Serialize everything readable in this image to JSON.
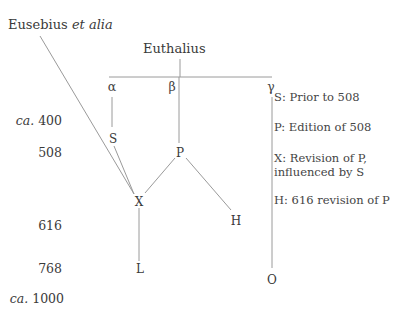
{
  "sources": {
    "eusebius": {
      "name": "Eusebius",
      "suffix": "et alia"
    },
    "euthalius": "Euthalius"
  },
  "branches": [
    "α",
    "β",
    "γ"
  ],
  "dates": [
    "ca. 400",
    "508",
    "616",
    "768",
    "ca. 1000"
  ],
  "dates_display": [
    {
      "prefix": "ca.",
      "value": "400"
    },
    {
      "prefix": "",
      "value": "508"
    },
    {
      "prefix": "",
      "value": "616"
    },
    {
      "prefix": "",
      "value": "768"
    },
    {
      "prefix": "ca.",
      "value": "1000"
    }
  ],
  "nodes": {
    "S": "S",
    "P": "P",
    "X": "X",
    "H": "H",
    "L": "L",
    "O": "O"
  },
  "legend": [
    {
      "text": "S: Prior to 508"
    },
    {
      "text": "P: Edition of 508"
    },
    {
      "text": "X: Revision of P,",
      "line2": "influenced by S"
    },
    {
      "text": "H: 616 revision of P"
    }
  ],
  "colors": {
    "line": "#9a9a9a",
    "text": "#3a3a3a"
  }
}
